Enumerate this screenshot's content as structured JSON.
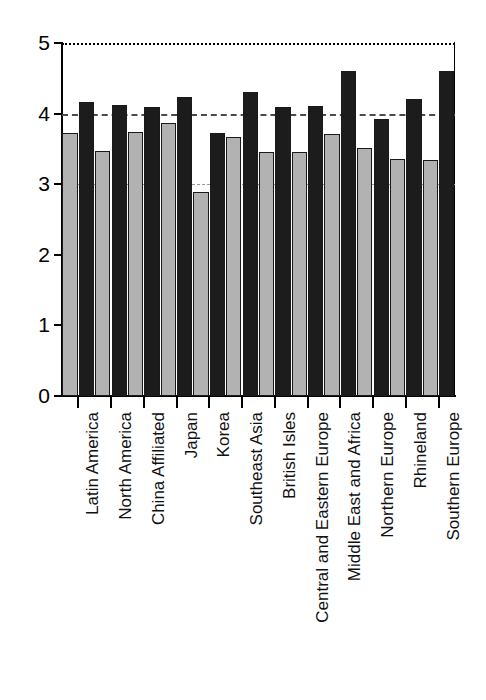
{
  "chart_data": {
    "type": "bar",
    "title": "",
    "subtitle": "",
    "xlabel": "",
    "ylabel": "",
    "ylim": [
      0,
      5
    ],
    "y_ticks": [
      0,
      1,
      2,
      3,
      4,
      5
    ],
    "grid": false,
    "legend_position": "none",
    "orientation": "vertical",
    "grouping": "grouped",
    "categories": [
      "Latin America",
      "North America",
      "China Affiliated",
      "Japan",
      "Korea",
      "Southeast Asia",
      "British Isles",
      "Central and Eastern Europe",
      "Middle East and Africa",
      "Northern Europe",
      "Rhineland",
      "Southern Europe"
    ],
    "series": [
      {
        "name": "series-a",
        "color": "#b2b2b2",
        "values": [
          3.73,
          3.47,
          3.74,
          3.86,
          2.89,
          3.67,
          3.45,
          3.45,
          3.71,
          3.51,
          3.36,
          3.35
        ]
      },
      {
        "name": "series-b",
        "color": "#1c1c1c",
        "values": [
          4.16,
          4.12,
          4.1,
          4.24,
          3.73,
          4.31,
          4.09,
          4.11,
          4.61,
          3.92,
          4.21,
          4.6
        ]
      }
    ],
    "reference_lines": [
      {
        "name": "top-dotted",
        "value": 5,
        "style": "dotted",
        "color": "#000000"
      },
      {
        "name": "mid-dashed",
        "value": 4,
        "style": "dashed",
        "color": "#4a4a4a"
      },
      {
        "name": "low-faint",
        "value": 3,
        "style": "dashed",
        "color": "#9a9a9a"
      }
    ]
  },
  "axis": {
    "y_tick_labels": [
      "5",
      "4",
      "3",
      "2",
      "1",
      "0"
    ]
  }
}
